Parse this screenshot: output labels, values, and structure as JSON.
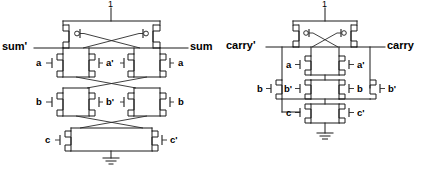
{
  "figure": {
    "type": "cmos-transistor-schematic",
    "background_color": "#ffffff",
    "line_color": "#1a1a1a"
  },
  "circuits": [
    {
      "id": "sum-circuit",
      "name": "sum",
      "supply_label": "1",
      "ground_label": "",
      "output_left_label": "sum'",
      "output_right_label": "sum",
      "rows": [
        {
          "row": "pmos-cross-coupled",
          "labels": []
        },
        {
          "row": "a-row",
          "labels": [
            "a",
            "a'",
            "a"
          ]
        },
        {
          "row": "b-row",
          "labels": [
            "b",
            "b'",
            "b"
          ]
        },
        {
          "row": "c-row",
          "labels": [
            "c",
            "c'"
          ]
        }
      ]
    },
    {
      "id": "carry-circuit",
      "name": "carry",
      "supply_label": "1",
      "ground_label": "",
      "output_left_label": "carry'",
      "output_right_label": "carry",
      "rows": [
        {
          "row": "pmos-cross-coupled",
          "labels": []
        },
        {
          "row": "a-row",
          "labels": [
            "a",
            "a'"
          ]
        },
        {
          "row": "b-row",
          "labels": [
            "b",
            "b'",
            "b",
            "b'"
          ]
        },
        {
          "row": "c-row",
          "labels": [
            "c",
            "c'"
          ]
        }
      ]
    }
  ],
  "labels": {
    "left": {
      "vdd": "1",
      "sum_bar": "sum'",
      "sum": "sum",
      "a_left": "a",
      "a_mid": "a'",
      "a_right": "a",
      "b_left": "b",
      "b_mid": "b'",
      "b_right": "b",
      "c_left": "c",
      "c_right": "c'"
    },
    "right": {
      "vdd": "1",
      "carry_bar": "carry'",
      "carry": "carry",
      "a_left": "a",
      "a_right": "a'",
      "b_far_left": "b",
      "b_left": "b'",
      "b_right": "b",
      "b_far_right": "b'",
      "c_left": "c",
      "c_right": "c'"
    }
  }
}
